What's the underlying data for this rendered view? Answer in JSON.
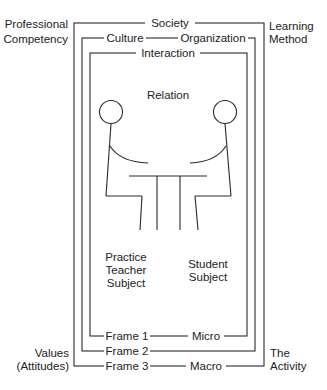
{
  "diagram": {
    "corner_labels": {
      "top_left": [
        "Professional",
        "Competency"
      ],
      "top_right": [
        "Learning",
        "Method"
      ],
      "bottom_left": [
        "Values",
        "(Attitudes)"
      ],
      "bottom_right": [
        "The",
        "Activity"
      ]
    },
    "outer_frame": {
      "top_label": "Society",
      "bottom_left_label": "Frame 3",
      "bottom_right_label": "Macro"
    },
    "middle_frame": {
      "top_left_label": "Culture",
      "top_right_label": "Organization",
      "bottom_label": "Frame 2"
    },
    "inner_frame": {
      "top_label": "Interaction",
      "bottom_left_label": "Frame 1",
      "bottom_right_label": "Micro"
    },
    "center": {
      "title": "Relation",
      "left_figure_label": [
        "Practice",
        "Teacher",
        "Subject"
      ],
      "right_figure_label": [
        "Student",
        "Subject"
      ]
    },
    "colors": {
      "line": "#2a2a2a",
      "text": "#222222",
      "background": "#ffffff"
    }
  }
}
